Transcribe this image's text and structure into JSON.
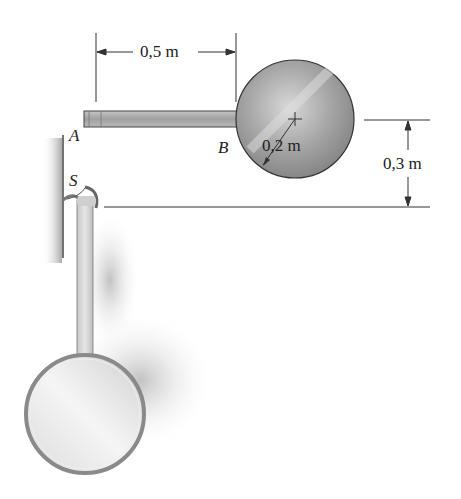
{
  "figure": {
    "labels": {
      "point_a": "A",
      "point_b": "B",
      "point_s": "S"
    },
    "dimensions": {
      "rod_length": "0,5 m",
      "disk_radius": "0,2 m",
      "drop_height": "0,3 m"
    },
    "colors": {
      "line": "#333333",
      "rod_fill": "#a8a8a8",
      "disk_fill": "#9a9a9a",
      "shadow": "#c8c8c8"
    }
  }
}
